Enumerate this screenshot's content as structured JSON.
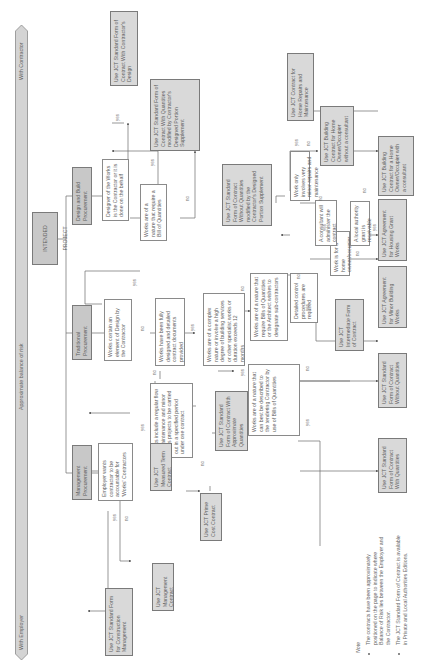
{
  "risk_bar": {
    "left_label": "With Employer",
    "center_label": "Approximate balance of risk",
    "right_label": "With Contractor"
  },
  "root": "INTENDED PROJECT",
  "procurement": {
    "design_build": "Design and Build Procurement",
    "traditional": "Traditional Procurement",
    "management": "Management Procurement"
  },
  "decisions": {
    "designer_contractor": "Designer of the Works is the Contractor or it is done on the behalf",
    "bill_of_quantities_db": "Works are of a nature that require a Bill of Quantities",
    "element_of_design": "Works contain an element of Design by the Contractor",
    "fully_designed": "Works have been fully designed and detailed contract documents provided",
    "complex_nature": "Works are of a complex nature or involve a high degree of building services or other specialist works or duration exceeds 12 months",
    "regular_flow": "Works include a regular flow of maintenance and minor works projects to be carried out in a specified period under one contract",
    "employer_accountable": "Employer wants contractor to be accountable for 'Works' Contractors",
    "require_boq_architect": "Works are of a nature that require Bills of Quantities or the Architect wishes to designate sub-contractors",
    "described_bills": "Works are of a nature that can best be described to the tendering Contractor by use of Bills of Quantities",
    "detailed_control": "Detailed control procedures are required",
    "home_owner": "Work is for a home owner/occupier",
    "consultant_administer": "A consultant will administer the contract",
    "minor_repairs": "Work only involves very minor repairs and maintenance",
    "local_authority_grant": "A local authority grant is receivable"
  },
  "outcomes": {
    "contractors_design": "Use JCT Standard Form of Contract With Contractor's Design",
    "with_quantities_cdps": "Use JCT Standard Form of Contract With Quantities modified by Contractor's Designed Portion Supplement",
    "without_quantities_cdps": "Use JCT Standard Form of Contract Without Quantities modified by the Contractor's Designed Portion Supplement",
    "home_repairs": "Use JCT Contract for Home Repairs and Maintenance",
    "home_without_consultant": "Use JCT Building Contract for Home Owner/Occupier without a consultant",
    "home_with_consultant": "Use JCT Building Contract for a Home Owner/Occupier with a consultant",
    "housing_grant": "Use JCT Agreement for Housing Grant Works",
    "minor_building": "Use JCT Agreement for Minor Building Works",
    "intermediate": "Use JCT Intermediate Form of Contract",
    "without_quantities": "Use JCT Standard Form of Contract Without Quantities",
    "with_quantities": "Use JCT Standard Form of Contract With Quantities",
    "approx_quantities": "Use JCT Standard Form of Contract With Approximate Quantities",
    "measured_term": "Use JCT Measured Term Contract",
    "prime_cost": "Use JCT Prime Cost Contract",
    "management_contract": "Use JCT Management Contract",
    "construction_management": "Use JCT Standard Form for Construction Management"
  },
  "edge_labels": {
    "yes": "yes",
    "no": "no"
  },
  "note": {
    "title": "Note",
    "items": [
      "The contracts have been approximately positioned on the page to indicate where Balance of Risk lies between the Employer and the Contractor.",
      "The JCT Standard Form of Contract is available in Private and Local Authorities Editions."
    ]
  }
}
